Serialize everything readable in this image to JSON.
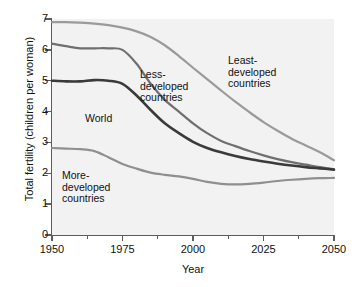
{
  "chart_data": {
    "type": "line",
    "title": "",
    "xlabel": "Year",
    "ylabel": "Total fertility (children per woman)",
    "xlim": [
      1950,
      2050
    ],
    "ylim": [
      0,
      7
    ],
    "grid": false,
    "legend_position": "inline-annotations",
    "x_ticks": [
      "1950",
      "1975",
      "2000",
      "2025",
      "2050"
    ],
    "x_tick_values": [
      1950,
      1975,
      2000,
      2025,
      2050
    ],
    "x_minor_tick_values": [
      1962.5,
      1987.5,
      2012.5,
      2037.5
    ],
    "y_ticks": [
      "0",
      "1",
      "2",
      "3",
      "4",
      "5",
      "6",
      "7"
    ],
    "y_tick_values": [
      0,
      1,
      2,
      3,
      4,
      5,
      6,
      7
    ],
    "x": [
      1950,
      1955,
      1960,
      1965,
      1970,
      1975,
      1980,
      1985,
      1990,
      1995,
      2000,
      2005,
      2010,
      2015,
      2020,
      2025,
      2030,
      2035,
      2040,
      2045,
      2050
    ],
    "series": [
      {
        "name": "Least-developed countries",
        "color": "#9a9a9a",
        "annotation": "Least-\ndeveloped\ncountries",
        "values": [
          6.9,
          6.9,
          6.88,
          6.85,
          6.8,
          6.72,
          6.6,
          6.42,
          6.15,
          5.8,
          5.42,
          5.05,
          4.68,
          4.32,
          3.98,
          3.66,
          3.38,
          3.12,
          2.9,
          2.68,
          2.42
        ]
      },
      {
        "name": "Less-developed countries",
        "color": "#6f6f6f",
        "annotation": "Less-\ndeveloped\ncountries",
        "values": [
          6.2,
          6.12,
          6.05,
          6.05,
          6.05,
          6.0,
          5.55,
          4.9,
          4.38,
          4.0,
          3.62,
          3.3,
          3.05,
          2.88,
          2.72,
          2.58,
          2.46,
          2.36,
          2.28,
          2.2,
          2.13
        ]
      },
      {
        "name": "World",
        "color": "#3a3a3a",
        "annotation": "World",
        "values": [
          5.0,
          4.98,
          4.98,
          5.02,
          5.0,
          4.9,
          4.52,
          4.05,
          3.62,
          3.3,
          3.02,
          2.82,
          2.68,
          2.56,
          2.46,
          2.38,
          2.31,
          2.25,
          2.2,
          2.16,
          2.12
        ]
      },
      {
        "name": "More-developed countries",
        "color": "#8f8f8f",
        "annotation": "More-\ndeveloped\ncountries",
        "values": [
          2.82,
          2.8,
          2.78,
          2.72,
          2.52,
          2.3,
          2.15,
          2.02,
          1.95,
          1.9,
          1.82,
          1.72,
          1.66,
          1.64,
          1.66,
          1.7,
          1.75,
          1.79,
          1.82,
          1.84,
          1.85
        ]
      }
    ]
  }
}
